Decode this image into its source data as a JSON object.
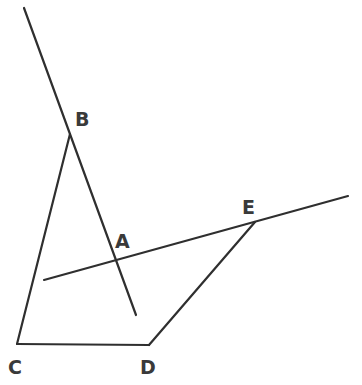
{
  "diagram": {
    "type": "geometry-figure",
    "stroke_color": "#2f2f2f",
    "label_color": "#3a3a3a",
    "background": "#ffffff",
    "points": {
      "A": {
        "label": "A",
        "x": 116,
        "y": 259
      },
      "B": {
        "label": "B",
        "x": 70,
        "y": 134
      },
      "C": {
        "label": "C",
        "x": 17,
        "y": 344
      },
      "D": {
        "label": "D",
        "x": 149,
        "y": 345
      },
      "E": {
        "label": "E",
        "x": 255,
        "y": 222
      }
    },
    "labels": [
      {
        "text": "B",
        "x": 75,
        "y": 126
      },
      {
        "text": "A",
        "x": 115,
        "y": 248
      },
      {
        "text": "E",
        "x": 242,
        "y": 214
      },
      {
        "text": "C",
        "x": 8,
        "y": 374
      },
      {
        "text": "D",
        "x": 140,
        "y": 374
      }
    ],
    "segments": [
      {
        "name": "line-through-B-A",
        "from": [
          24,
          8
        ],
        "to": [
          136,
          315
        ],
        "description": "Line passing through B and A, extending beyond both"
      },
      {
        "name": "segment-BC",
        "from": [
          70,
          134
        ],
        "to": [
          17,
          344
        ]
      },
      {
        "name": "segment-CD",
        "from": [
          17,
          344
        ],
        "to": [
          149,
          345
        ]
      },
      {
        "name": "segment-DE",
        "from": [
          149,
          345
        ],
        "to": [
          255,
          222
        ]
      },
      {
        "name": "line-through-A-E",
        "from": [
          44,
          280
        ],
        "to": [
          348,
          196
        ],
        "description": "Line passing through A and E, extending beyond both"
      }
    ]
  }
}
